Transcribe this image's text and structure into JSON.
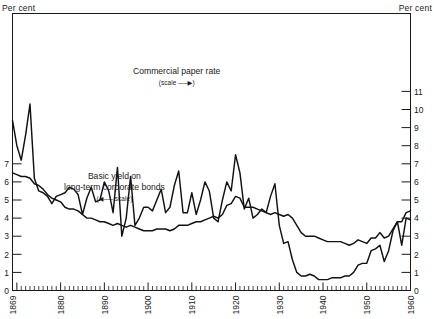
{
  "axes": {
    "left_title": "Per cent",
    "right_title": "Per cent",
    "left_ticks": [
      0,
      1,
      2,
      3,
      4,
      5,
      6,
      7
    ],
    "right_ticks": [
      0,
      1,
      2,
      3,
      4,
      5,
      6,
      7,
      8,
      9,
      10,
      11
    ],
    "year_ticks": [
      1869,
      1880,
      1890,
      1900,
      1910,
      1920,
      1930,
      1940,
      1950,
      1960
    ]
  },
  "annotations": {
    "commercial": {
      "line1": "Commercial paper rate",
      "line2": "(scale ──▶)"
    },
    "bonds": {
      "line1": "Basic yield on",
      "line2": "long-term corporate bonds",
      "line3": "(◀── scale)"
    }
  },
  "chart_data": {
    "type": "line",
    "title": "",
    "xlabel": "",
    "ylabel": "Per cent",
    "grid": false,
    "legend": "inline-annotations",
    "xlim": [
      1869,
      1960
    ],
    "axes": {
      "left": {
        "label": "Per cent",
        "range": [
          0,
          7
        ],
        "ticks": [
          0,
          1,
          2,
          3,
          4,
          5,
          6,
          7
        ],
        "series": "Basic yield on long-term corporate bonds"
      },
      "right": {
        "label": "Per cent",
        "range": [
          0,
          11
        ],
        "ticks": [
          0,
          1,
          2,
          3,
          4,
          5,
          6,
          7,
          8,
          9,
          10,
          11
        ],
        "series": "Commercial paper rate"
      }
    },
    "series": [
      {
        "name": "Commercial paper rate",
        "axis": "right",
        "unit": "per cent",
        "x": [
          1869,
          1870,
          1871,
          1872,
          1873,
          1874,
          1875,
          1876,
          1877,
          1878,
          1879,
          1880,
          1881,
          1882,
          1883,
          1884,
          1885,
          1886,
          1887,
          1888,
          1889,
          1890,
          1891,
          1892,
          1893,
          1894,
          1895,
          1896,
          1897,
          1898,
          1899,
          1900,
          1901,
          1902,
          1903,
          1904,
          1905,
          1906,
          1907,
          1908,
          1909,
          1910,
          1911,
          1912,
          1913,
          1914,
          1915,
          1916,
          1917,
          1918,
          1919,
          1920,
          1921,
          1922,
          1923,
          1924,
          1925,
          1926,
          1927,
          1928,
          1929,
          1930,
          1931,
          1932,
          1933,
          1934,
          1935,
          1936,
          1937,
          1938,
          1939,
          1940,
          1941,
          1942,
          1943,
          1944,
          1945,
          1946,
          1947,
          1948,
          1949,
          1950,
          1951,
          1952,
          1953,
          1954,
          1955,
          1956,
          1957,
          1958,
          1959,
          1960
        ],
        "values": [
          9.4,
          8.0,
          7.2,
          8.6,
          10.3,
          6.2,
          5.5,
          5.4,
          5.2,
          4.8,
          5.2,
          5.3,
          5.4,
          5.7,
          5.6,
          5.3,
          4.2,
          5.1,
          5.7,
          4.9,
          5.0,
          6.0,
          5.5,
          4.3,
          6.8,
          3.0,
          4.0,
          6.3,
          3.6,
          4.0,
          4.6,
          4.6,
          4.4,
          5.0,
          5.6,
          4.3,
          4.6,
          5.8,
          6.6,
          4.3,
          4.3,
          5.4,
          4.2,
          5.0,
          6.0,
          5.5,
          4.0,
          3.8,
          5.0,
          6.0,
          5.5,
          7.5,
          6.5,
          4.5,
          5.1,
          4.0,
          4.2,
          4.5,
          4.3,
          5.2,
          5.9,
          3.6,
          2.6,
          2.7,
          1.7,
          1.0,
          0.8,
          0.8,
          0.9,
          0.8,
          0.6,
          0.6,
          0.6,
          0.7,
          0.7,
          0.7,
          0.8,
          0.8,
          1.0,
          1.4,
          1.5,
          1.5,
          2.2,
          2.3,
          2.5,
          1.6,
          2.2,
          3.3,
          3.8,
          2.5,
          4.0,
          3.9
        ]
      },
      {
        "name": "Basic yield on long-term corporate bonds",
        "axis": "left",
        "unit": "per cent",
        "x": [
          1869,
          1870,
          1871,
          1872,
          1873,
          1874,
          1875,
          1876,
          1877,
          1878,
          1879,
          1880,
          1881,
          1882,
          1883,
          1884,
          1885,
          1886,
          1887,
          1888,
          1889,
          1890,
          1891,
          1892,
          1893,
          1894,
          1895,
          1896,
          1897,
          1898,
          1899,
          1900,
          1901,
          1902,
          1903,
          1904,
          1905,
          1906,
          1907,
          1908,
          1909,
          1910,
          1911,
          1912,
          1913,
          1914,
          1915,
          1916,
          1917,
          1918,
          1919,
          1920,
          1921,
          1922,
          1923,
          1924,
          1925,
          1926,
          1927,
          1928,
          1929,
          1930,
          1931,
          1932,
          1933,
          1934,
          1935,
          1936,
          1937,
          1938,
          1939,
          1940,
          1941,
          1942,
          1943,
          1944,
          1945,
          1946,
          1947,
          1948,
          1949,
          1950,
          1951,
          1952,
          1953,
          1954,
          1955,
          1956,
          1957,
          1958,
          1959,
          1960
        ],
        "values": [
          6.5,
          6.4,
          6.3,
          6.3,
          6.2,
          5.9,
          5.8,
          5.6,
          5.3,
          5.1,
          5.0,
          4.9,
          4.6,
          4.5,
          4.5,
          4.4,
          4.2,
          4.0,
          4.0,
          3.9,
          3.8,
          3.8,
          3.7,
          3.6,
          3.7,
          3.6,
          3.5,
          3.6,
          3.5,
          3.4,
          3.3,
          3.3,
          3.3,
          3.4,
          3.4,
          3.4,
          3.3,
          3.4,
          3.6,
          3.6,
          3.6,
          3.7,
          3.8,
          3.8,
          3.9,
          4.0,
          4.1,
          4.0,
          4.2,
          4.7,
          4.8,
          5.2,
          5.1,
          4.6,
          4.6,
          4.6,
          4.5,
          4.4,
          4.3,
          4.2,
          4.3,
          4.2,
          4.1,
          4.2,
          4.0,
          3.6,
          3.2,
          3.0,
          3.0,
          3.0,
          2.9,
          2.8,
          2.7,
          2.7,
          2.7,
          2.7,
          2.6,
          2.5,
          2.6,
          2.8,
          2.7,
          2.6,
          2.9,
          2.9,
          3.2,
          2.9,
          3.0,
          3.4,
          3.8,
          3.8,
          4.3,
          4.4
        ]
      }
    ]
  }
}
